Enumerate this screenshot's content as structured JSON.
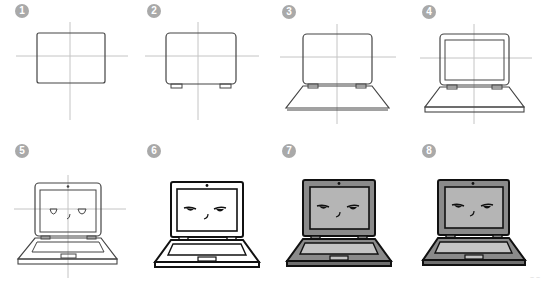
{
  "colors": {
    "badge": "#a9a9a9",
    "guide": "#bdbdbd",
    "sketch": "#555555",
    "ink": "#111111",
    "fill_body": "#8a8a8a",
    "fill_screen": "#b5b5b5"
  },
  "steps": [
    {
      "number": "1",
      "description": "Rectangle with guide lines"
    },
    {
      "number": "2",
      "description": "Rounded screen with hinges"
    },
    {
      "number": "3",
      "description": "Keyboard base trapezoid"
    },
    {
      "number": "4",
      "description": "Screen inner border and base thickness"
    },
    {
      "number": "5",
      "description": "Face, camera, keyboard and touchpad"
    },
    {
      "number": "6",
      "description": "Inked outline"
    },
    {
      "number": "7",
      "description": "Gray fill"
    },
    {
      "number": "8",
      "description": "Final shading"
    }
  ],
  "watermark": "~ ~"
}
